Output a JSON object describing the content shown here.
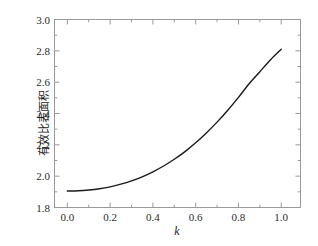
{
  "chart_data": {
    "type": "line",
    "title": "",
    "subtitle": "",
    "xlabel": "k",
    "ylabel": "有效比表面积",
    "xlim": [
      -0.06,
      1.09
    ],
    "ylim": [
      1.8,
      3.0
    ],
    "grid": false,
    "legend": null,
    "xticks": [
      "0.0",
      "0.2",
      "0.4",
      "0.6",
      "0.8",
      "1.0"
    ],
    "xtick_values": [
      0.0,
      0.2,
      0.4,
      0.6,
      0.8,
      1.0
    ],
    "x_minor_step": 0.1,
    "yticks": [
      "1.8",
      "2.0",
      "2.2",
      "2.4",
      "2.6",
      "2.8",
      "3.0"
    ],
    "ytick_values": [
      1.8,
      2.0,
      2.2,
      2.4,
      2.6,
      2.8,
      3.0
    ],
    "y_minor_step": 0.1,
    "tick_direction": "in",
    "line_color": "#1a1a1a",
    "frame_color": "#9a9a9a",
    "background_color": "#ffffff",
    "series": [
      {
        "name": "有效比表面积",
        "x": [
          0.0,
          0.05,
          0.1,
          0.15,
          0.2,
          0.25,
          0.3,
          0.35,
          0.4,
          0.45,
          0.5,
          0.55,
          0.6,
          0.65,
          0.7,
          0.75,
          0.8,
          0.85,
          0.9,
          0.95,
          1.0
        ],
        "values": [
          1.905,
          1.907,
          1.912,
          1.92,
          1.932,
          1.949,
          1.97,
          1.996,
          2.028,
          2.065,
          2.108,
          2.157,
          2.213,
          2.276,
          2.345,
          2.421,
          2.503,
          2.59,
          2.667,
          2.743,
          2.81
        ]
      }
    ]
  },
  "axis": {
    "y_title": "有效比表面积",
    "x_title": "k"
  }
}
